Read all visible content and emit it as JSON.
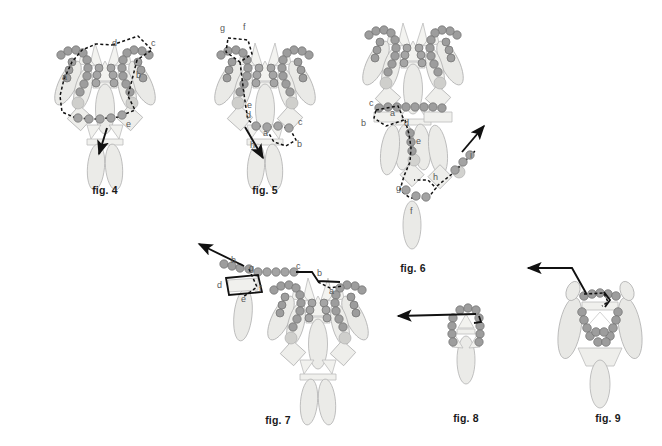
{
  "page": {
    "width": 662,
    "height": 446,
    "background": "#ffffff",
    "style": "line-art scientific plate, grayscale"
  },
  "palette": {
    "bead_fill": "#9a9a9a",
    "bead_stroke": "#6e6e6e",
    "bead_light_fill": "#c9c9c6",
    "petal_fill": "#ebebe8",
    "petal_stroke": "#b2b2b2",
    "diamond_fill": "#ededea",
    "diamond_stroke": "#b2b2b2",
    "path_stroke": "#111111",
    "label_color": "#585858",
    "caption_color": "#1a1a1a"
  },
  "figures": [
    {
      "id": "fig4",
      "caption": "fig. 4",
      "caption_x": 105,
      "caption_y": 190,
      "center_x": 105,
      "center_y": 95,
      "labels": [
        "a",
        "b",
        "c",
        "d",
        "e"
      ],
      "label_points": [
        {
          "text": "a",
          "x": 62,
          "y": 80
        },
        {
          "text": "b",
          "x": 136,
          "y": 78
        },
        {
          "text": "c",
          "x": 151,
          "y": 46
        },
        {
          "text": "d",
          "x": 112,
          "y": 46
        },
        {
          "text": "e",
          "x": 126,
          "y": 127
        }
      ],
      "arrow": {
        "x1": 107,
        "y1": 128,
        "x2": 98,
        "y2": 156
      },
      "description": "closed dashed loop around central body, arrow exits downward"
    },
    {
      "id": "fig5",
      "caption": "fig. 5",
      "caption_x": 265,
      "caption_y": 190,
      "center_x": 265,
      "center_y": 95,
      "labels": [
        "a",
        "b",
        "c",
        "d",
        "e",
        "f",
        "g",
        "h"
      ],
      "label_points": [
        {
          "text": "g",
          "x": 223,
          "y": 31
        },
        {
          "text": "f",
          "x": 245,
          "y": 30
        },
        {
          "text": "e",
          "x": 247,
          "y": 107
        },
        {
          "text": "d",
          "x": 247,
          "y": 117
        },
        {
          "text": "a",
          "x": 264,
          "y": 134
        },
        {
          "text": "c",
          "x": 297,
          "y": 124
        },
        {
          "text": "b",
          "x": 297,
          "y": 145
        },
        {
          "text": "h",
          "x": 251,
          "y": 146
        }
      ],
      "arrow": {
        "x1": 244,
        "y1": 127,
        "x2": 262,
        "y2": 160
      },
      "description": "dashed path down left side, small loop at lower right, arrow exits down-right"
    },
    {
      "id": "fig6",
      "caption": "fig. 6",
      "caption_x": 413,
      "caption_y": 237,
      "center_x": 413,
      "center_y": 100,
      "labels": [
        "a",
        "b",
        "c",
        "d",
        "e",
        "f",
        "g",
        "h",
        "i"
      ],
      "label_points": [
        {
          "text": "c",
          "x": 371,
          "y": 105
        },
        {
          "text": "a",
          "x": 391,
          "y": 114
        },
        {
          "text": "b",
          "x": 364,
          "y": 124
        },
        {
          "text": "d",
          "x": 404,
          "y": 124
        },
        {
          "text": "e",
          "x": 414,
          "y": 142
        },
        {
          "text": "h",
          "x": 433,
          "y": 178
        },
        {
          "text": "g",
          "x": 398,
          "y": 189
        },
        {
          "text": "f",
          "x": 413,
          "y": 212
        },
        {
          "text": "i",
          "x": 468,
          "y": 155
        }
      ],
      "arrow": {
        "x1": 455,
        "y1": 158,
        "x2": 481,
        "y2": 128
      },
      "description": "long dashed trail descending then rising, arrow exits up-right"
    },
    {
      "id": "fig7",
      "caption": "fig. 7",
      "caption_x": 278,
      "caption_y": 421,
      "center_x": 278,
      "center_y": 320,
      "labels": [
        "a",
        "b",
        "c",
        "d",
        "e",
        "f",
        "g",
        "h"
      ],
      "label_points": [
        {
          "text": "h",
          "x": 233,
          "y": 262
        },
        {
          "text": "g",
          "x": 249,
          "y": 271
        },
        {
          "text": "c",
          "x": 297,
          "y": 268
        },
        {
          "text": "b",
          "x": 317,
          "y": 275
        },
        {
          "text": "d",
          "x": 219,
          "y": 287
        },
        {
          "text": "f",
          "x": 260,
          "y": 290
        },
        {
          "text": "e",
          "x": 243,
          "y": 300
        },
        {
          "text": "a",
          "x": 329,
          "y": 292
        }
      ],
      "arrow": {
        "x1": 245,
        "y1": 268,
        "x2": 198,
        "y2": 243
      },
      "description": "two bodies joined by bead bridge, arrow exits up-left"
    },
    {
      "id": "fig8",
      "caption": "fig. 8",
      "caption_x": 466,
      "caption_y": 418,
      "center_x": 466,
      "center_y": 340,
      "labels": [],
      "label_points": [],
      "arrow": {
        "x1": 479,
        "y1": 316,
        "x2": 400,
        "y2": 317
      },
      "description": "single small body, arrow exits horizontally to the left"
    },
    {
      "id": "fig9",
      "caption": "fig. 9",
      "caption_x": 608,
      "caption_y": 418,
      "center_x": 600,
      "center_y": 330,
      "labels": [],
      "label_points": [],
      "arrow": {
        "x1": 596,
        "y1": 292,
        "x2": 527,
        "y2": 270
      },
      "description": "body viewed from above, arrow exits up-left"
    }
  ],
  "legend_note": "Lowercase letters a-i mark successive positions along the dashed trajectory in each figure."
}
